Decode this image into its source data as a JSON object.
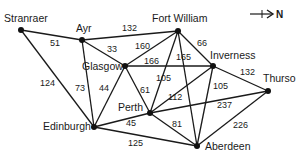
{
  "compass": {
    "label": "N",
    "icon": "north-arrow-icon"
  },
  "nodes": [
    {
      "id": "stranraer",
      "label": "Stranraer",
      "x": 21,
      "y": 30,
      "lx": 4,
      "ly": 22
    },
    {
      "id": "ayr",
      "label": "Ayr",
      "x": 82,
      "y": 40,
      "lx": 76,
      "ly": 32
    },
    {
      "id": "fortwilliam",
      "label": "Fort William",
      "x": 178,
      "y": 31,
      "lx": 152,
      "ly": 22
    },
    {
      "id": "glasgow",
      "label": "Glasgow",
      "x": 125,
      "y": 66,
      "lx": 82,
      "ly": 70
    },
    {
      "id": "inverness",
      "label": "Inverness",
      "x": 213,
      "y": 66,
      "lx": 210,
      "ly": 59
    },
    {
      "id": "thurso",
      "label": "Thurso",
      "x": 268,
      "y": 91,
      "lx": 263,
      "ly": 82
    },
    {
      "id": "perth",
      "label": "Perth",
      "x": 150,
      "y": 113,
      "lx": 118,
      "ly": 111
    },
    {
      "id": "edinburgh",
      "label": "Edinburgh",
      "x": 94,
      "y": 127,
      "lx": 43,
      "ly": 130
    },
    {
      "id": "aberdeen",
      "label": "Aberdeen",
      "x": 197,
      "y": 146,
      "lx": 205,
      "ly": 150
    }
  ],
  "edges": [
    {
      "from": "stranraer",
      "to": "ayr",
      "weight": "51",
      "wx": 50,
      "wy": 46
    },
    {
      "from": "stranraer",
      "to": "edinburgh",
      "weight": "124",
      "wx": 40,
      "wy": 86
    },
    {
      "from": "ayr",
      "to": "fortwilliam",
      "weight": "132",
      "wx": 122,
      "wy": 31
    },
    {
      "from": "ayr",
      "to": "glasgow",
      "weight": "33",
      "wx": 107,
      "wy": 52
    },
    {
      "from": "ayr",
      "to": "edinburgh",
      "weight": "73",
      "wx": 75,
      "wy": 91
    },
    {
      "from": "glasgow",
      "to": "fortwilliam",
      "weight": "160",
      "wx": 135,
      "wy": 49
    },
    {
      "from": "glasgow",
      "to": "inverness",
      "weight": "166",
      "wx": 144,
      "wy": 64
    },
    {
      "from": "glasgow",
      "to": "edinburgh",
      "weight": "44",
      "wx": 99,
      "wy": 91
    },
    {
      "from": "glasgow",
      "to": "perth",
      "weight": "61",
      "wx": 140,
      "wy": 93
    },
    {
      "from": "fortwilliam",
      "to": "inverness",
      "weight": "66",
      "wx": 197,
      "wy": 46
    },
    {
      "from": "fortwilliam",
      "to": "perth",
      "weight": "105",
      "wx": 156,
      "wy": 81
    },
    {
      "from": "fortwilliam",
      "to": "aberdeen",
      "weight": "165",
      "wx": 176,
      "wy": 60
    },
    {
      "from": "inverness",
      "to": "perth",
      "weight": "112",
      "wx": 168,
      "wy": 100
    },
    {
      "from": "inverness",
      "to": "aberdeen",
      "weight": "105",
      "wx": 213,
      "wy": 89
    },
    {
      "from": "inverness",
      "to": "thurso",
      "weight": "132",
      "wx": 240,
      "wy": 75
    },
    {
      "from": "perth",
      "to": "thurso",
      "weight": "237",
      "wx": 217,
      "wy": 108
    },
    {
      "from": "perth",
      "to": "edinburgh",
      "weight": "45",
      "wx": 126,
      "wy": 126
    },
    {
      "from": "perth",
      "to": "aberdeen",
      "weight": "81",
      "wx": 172,
      "wy": 127
    },
    {
      "from": "edinburgh",
      "to": "aberdeen",
      "weight": "125",
      "wx": 128,
      "wy": 146
    },
    {
      "from": "thurso",
      "to": "aberdeen",
      "weight": "226",
      "wx": 233,
      "wy": 128
    }
  ]
}
